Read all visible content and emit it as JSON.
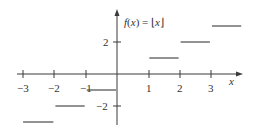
{
  "chart_data": {
    "type": "line",
    "title": "f(x) = ⌊x⌋",
    "title_parts": {
      "f": "f",
      "open": "(",
      "x": "x",
      "close": ") = ⌊",
      "x2": "x",
      "end": "⌋"
    },
    "xlabel": "x",
    "ylabel": "",
    "xlim": [
      -3.2,
      4.0
    ],
    "ylim": [
      -3.3,
      3.5
    ],
    "x_ticks": [
      -3,
      -2,
      -1,
      1,
      2,
      3
    ],
    "x_tick_labels": [
      "−3",
      "−2",
      "−1",
      "1",
      "2",
      "3"
    ],
    "y_ticks": [
      2,
      -2
    ],
    "y_tick_labels": [
      "2",
      "−2"
    ],
    "grid": false,
    "series": [
      {
        "name": "floor",
        "segments": [
          {
            "x0": -3,
            "x1": -2,
            "y": -3
          },
          {
            "x0": -2,
            "x1": -1,
            "y": -2
          },
          {
            "x0": -1,
            "x1": 0,
            "y": -1
          },
          {
            "x0": 1,
            "x1": 2,
            "y": 1
          },
          {
            "x0": 2,
            "x1": 3,
            "y": 2
          },
          {
            "x0": 3,
            "x1": 4,
            "y": 3
          }
        ]
      }
    ]
  }
}
